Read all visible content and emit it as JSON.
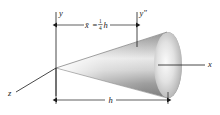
{
  "figure": {
    "background_color": "#ffffff",
    "line_color": "#1a1a1a",
    "cone": {
      "fill_light": "#fdfdfd",
      "fill_mid": "#b9b9b9",
      "fill_dark": "#6e6e6e",
      "base_highlight": "#f2f2f2"
    }
  },
  "axes": [
    {
      "name": "y-axis",
      "label": "y",
      "orientation": "vertical-left"
    },
    {
      "name": "y-double-prime-axis",
      "label": "y″",
      "orientation": "vertical-right"
    },
    {
      "name": "x-axis",
      "label": "x",
      "orientation": "horizontal-right"
    },
    {
      "name": "z-axis",
      "label": "z",
      "orientation": "diagonal-lower-left"
    }
  ],
  "labels": {
    "y": "y",
    "y_double_prime": "y″",
    "x": "x",
    "z": "z",
    "h": "h"
  },
  "dimensions": [
    {
      "name": "centroid-dimension",
      "symbol": "x̄",
      "equals": "=",
      "fraction_numerator": "1",
      "fraction_denominator": "4",
      "variable": "h",
      "full_text": "x̄ = 1/4 h",
      "position": "top"
    },
    {
      "name": "height-dimension",
      "symbol": "h",
      "full_text": "h",
      "position": "bottom"
    }
  ]
}
